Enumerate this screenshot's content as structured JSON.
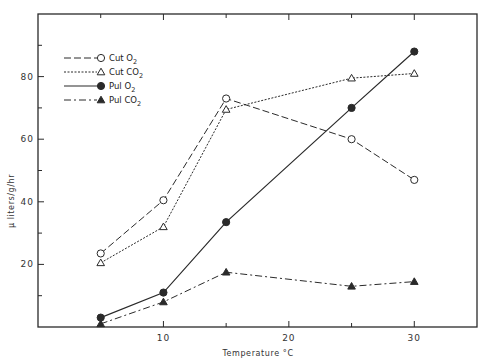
{
  "chart_data": {
    "type": "line",
    "title": "",
    "xlabel": "Temperature °C",
    "ylabel": "μ liters/g/hr",
    "xlim": [
      0,
      35
    ],
    "ylim": [
      0,
      100
    ],
    "x_ticks": [
      10,
      20,
      30
    ],
    "x_minor_ticks": [
      5,
      15,
      25
    ],
    "y_ticks": [
      20,
      40,
      60,
      80
    ],
    "y_minor_ticks": [
      10,
      30,
      50,
      70,
      90
    ],
    "grid": false,
    "legend_position": "upper-left",
    "x": [
      5,
      10,
      15,
      25,
      30
    ],
    "series": [
      {
        "name": "Cut O2",
        "label_main": "Cut O",
        "label_sub": "2",
        "values": [
          23.5,
          40.5,
          73,
          60,
          47
        ],
        "line_style": "long-dash",
        "marker": "open-circle"
      },
      {
        "name": "Cut CO2",
        "label_main": "Cut CO",
        "label_sub": "2",
        "values": [
          20.5,
          32,
          69.5,
          79.5,
          81
        ],
        "line_style": "dotted",
        "marker": "open-triangle"
      },
      {
        "name": "Pul O2",
        "label_main": "Pul O",
        "label_sub": "2",
        "values": [
          3,
          11,
          33.5,
          70,
          88
        ],
        "line_style": "solid",
        "marker": "filled-circle"
      },
      {
        "name": "Pul CO2",
        "label_main": "Pul CO",
        "label_sub": "2",
        "values": [
          1,
          8,
          17.5,
          13,
          14.5
        ],
        "line_style": "dash-dot",
        "marker": "filled-triangle"
      }
    ]
  },
  "colors": {
    "ink": "#2a2a2a",
    "background": "#ffffff"
  }
}
